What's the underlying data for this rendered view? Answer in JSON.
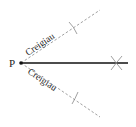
{
  "diagram": {
    "point_label": "P",
    "upper_ray_label": "Creigiau",
    "lower_ray_label": "Creigiau",
    "colors": {
      "solid_line": "#111111",
      "dashed_line": "#888888",
      "marks": "#888888",
      "text": "#222222"
    }
  }
}
